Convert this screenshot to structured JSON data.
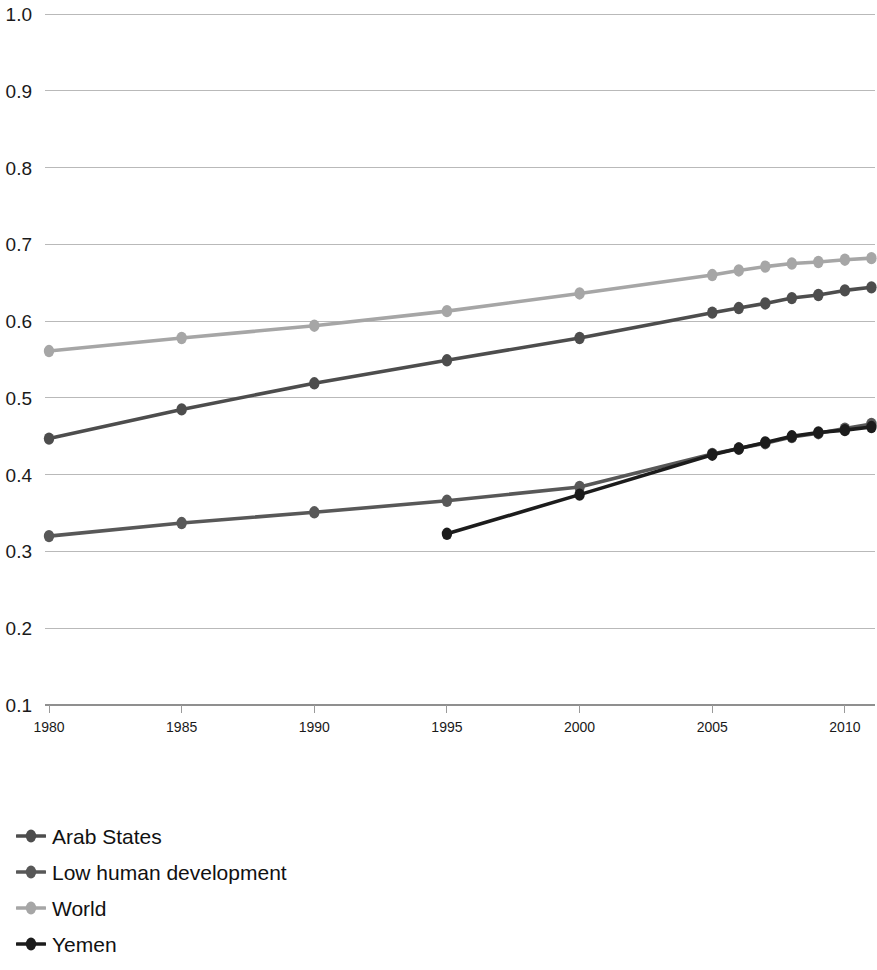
{
  "chart_data": {
    "type": "line",
    "title": "",
    "subtitle": "",
    "xlabel": "",
    "ylabel": "",
    "xlim": [
      1980,
      2011
    ],
    "ylim": [
      0.1,
      1.0
    ],
    "grid": true,
    "legend_position": "bottom-left",
    "y_ticks": [
      "1.0",
      "0.9",
      "0.8",
      "0.7",
      "0.6",
      "0.5",
      "0.4",
      "0.3",
      "0.2",
      "0.1"
    ],
    "y_tick_values": [
      1.0,
      0.9,
      0.8,
      0.7,
      0.6,
      0.5,
      0.4,
      0.3,
      0.2,
      0.1
    ],
    "x_ticks": [
      "1980",
      "1985",
      "1990",
      "1995",
      "2000",
      "2005",
      "2010"
    ],
    "x_tick_values": [
      1980,
      1985,
      1990,
      1995,
      2000,
      2005,
      2010
    ],
    "series": [
      {
        "name": "Arab States",
        "color": "#4d4d4d",
        "x": [
          1980,
          1985,
          1990,
          1995,
          2000,
          2005,
          2006,
          2007,
          2008,
          2009,
          2010,
          2011
        ],
        "values": [
          0.447,
          0.485,
          0.519,
          0.549,
          0.578,
          0.611,
          0.617,
          0.623,
          0.63,
          0.634,
          0.64,
          0.644
        ]
      },
      {
        "name": "Low human development",
        "color": "#585858",
        "x": [
          1980,
          1985,
          1990,
          1995,
          2000,
          2005,
          2006,
          2007,
          2008,
          2009,
          2010,
          2011
        ],
        "values": [
          0.32,
          0.337,
          0.351,
          0.366,
          0.384,
          0.427,
          0.434,
          0.441,
          0.449,
          0.454,
          0.46,
          0.466
        ]
      },
      {
        "name": "World",
        "color": "#a6a6a6",
        "x": [
          1980,
          1985,
          1990,
          1995,
          2000,
          2005,
          2006,
          2007,
          2008,
          2009,
          2010,
          2011
        ],
        "values": [
          0.561,
          0.578,
          0.594,
          0.613,
          0.636,
          0.66,
          0.666,
          0.671,
          0.675,
          0.677,
          0.68,
          0.682
        ]
      },
      {
        "name": "Yemen",
        "color": "#1c1c1c",
        "x": [
          1995,
          2000,
          2005,
          2006,
          2007,
          2008,
          2009,
          2010,
          2011
        ],
        "values": [
          0.323,
          0.374,
          0.426,
          0.434,
          0.442,
          0.45,
          0.455,
          0.458,
          0.462
        ]
      }
    ]
  },
  "legend": {
    "items": [
      {
        "label": "Arab States",
        "color": "#4d4d4d"
      },
      {
        "label": "Low human development",
        "color": "#585858"
      },
      {
        "label": "World",
        "color": "#a6a6a6"
      },
      {
        "label": "Yemen",
        "color": "#1c1c1c"
      }
    ]
  }
}
